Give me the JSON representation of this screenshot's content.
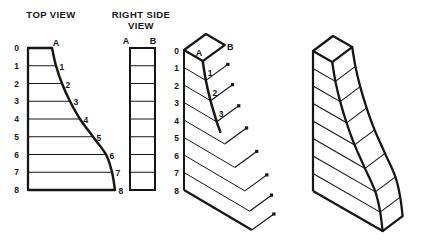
{
  "canvas": {
    "width": 424,
    "height": 248,
    "background": "#ffffff",
    "ink": "#161616"
  },
  "profile": {
    "level_labels": [
      "0",
      "1",
      "2",
      "3",
      "4",
      "5",
      "6",
      "7",
      "8"
    ],
    "widths": [
      24,
      28,
      34,
      42,
      52,
      65,
      78,
      84,
      87
    ],
    "depth": 25,
    "row_count": 8
  },
  "top_view": {
    "title": "TOP VIEW",
    "corner_label": "A",
    "curve_labels": [
      "1",
      "2",
      "3",
      "4",
      "5",
      "6",
      "7",
      "8"
    ],
    "origin": [
      28,
      48
    ],
    "dy": 17.75
  },
  "side_view": {
    "title_line1": "RIGHT SIDE",
    "title_line2": "VIEW",
    "label_a": "A",
    "label_b": "B",
    "x": 130,
    "y": 48,
    "width": 25,
    "height": 142,
    "rows": 8
  },
  "iso_construction": {
    "label_a": "A",
    "label_b": "B",
    "curve_labels": [
      "1",
      "2",
      "3"
    ],
    "axis_origin": [
      184,
      50
    ],
    "dy": 17.5,
    "w_unit": [
      0.78,
      0.46
    ],
    "depth_vec": [
      22,
      -16
    ],
    "plotted_curve_levels": 4
  },
  "final_view": {
    "origin": [
      313,
      51
    ],
    "dy": 17.5,
    "w_unit": [
      0.8,
      0.46
    ],
    "depth_vec": [
      20,
      -15
    ]
  }
}
